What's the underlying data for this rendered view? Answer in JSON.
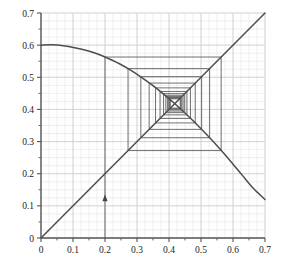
{
  "chart_data": {
    "type": "line",
    "title": "",
    "xlabel": "",
    "ylabel": "",
    "xlim": [
      0,
      0.7
    ],
    "ylim": [
      0,
      0.7
    ],
    "grid": true,
    "grid_major_step": 0.1,
    "grid_minor_step": 0.025,
    "legend": "none",
    "xticks": [
      0,
      0.1,
      0.2,
      0.3,
      0.4,
      0.5,
      0.6,
      0.7
    ],
    "yticks": [
      0,
      0.1,
      0.2,
      0.3,
      0.4,
      0.5,
      0.6,
      0.7
    ],
    "xtick_labels": [
      "0",
      "0.1",
      "0.2",
      "0.3",
      "0.4",
      "0.5",
      "0.6",
      "0.7"
    ],
    "ytick_labels": [
      "0",
      "0.1",
      "0.2",
      "0.3",
      "0.4",
      "0.5",
      "0.6",
      "0.7"
    ],
    "series": [
      {
        "name": "map-curve",
        "type": "line",
        "color": "#4d4d4d",
        "description": "concave-down map f(x) peaking near 0.60 at x=0 and falling to 0.12 at x=0.7",
        "points": [
          [
            0.0,
            0.6
          ],
          [
            0.035,
            0.601
          ],
          [
            0.07,
            0.598
          ],
          [
            0.105,
            0.592
          ],
          [
            0.14,
            0.584
          ],
          [
            0.175,
            0.573
          ],
          [
            0.2,
            0.563
          ],
          [
            0.245,
            0.542
          ],
          [
            0.28,
            0.522
          ],
          [
            0.315,
            0.499
          ],
          [
            0.35,
            0.474
          ],
          [
            0.385,
            0.446
          ],
          [
            0.42,
            0.416
          ],
          [
            0.455,
            0.384
          ],
          [
            0.49,
            0.35
          ],
          [
            0.525,
            0.314
          ],
          [
            0.56,
            0.276
          ],
          [
            0.595,
            0.236
          ],
          [
            0.63,
            0.194
          ],
          [
            0.665,
            0.153
          ],
          [
            0.7,
            0.12
          ]
        ]
      },
      {
        "name": "identity-line",
        "type": "line",
        "color": "#4d4d4d",
        "description": "y = x diagonal",
        "points": [
          [
            0.0,
            0.0
          ],
          [
            0.7,
            0.7
          ]
        ]
      },
      {
        "name": "cobweb-path",
        "type": "line",
        "color": "#555555",
        "description": "cobweb iteration starting at x0 = 0.2, spiralling inward to the fixed point near 0.43",
        "start_x": 0.2,
        "fixed_point": [
          0.432,
          0.432
        ],
        "points": [
          [
            0.2,
            0.0
          ],
          [
            0.2,
            0.563
          ],
          [
            0.563,
            0.563
          ],
          [
            0.563,
            0.272
          ],
          [
            0.272,
            0.272
          ],
          [
            0.272,
            0.527
          ],
          [
            0.527,
            0.527
          ],
          [
            0.527,
            0.312
          ],
          [
            0.312,
            0.312
          ],
          [
            0.312,
            0.502
          ],
          [
            0.502,
            0.502
          ],
          [
            0.502,
            0.338
          ],
          [
            0.338,
            0.338
          ],
          [
            0.338,
            0.482
          ],
          [
            0.482,
            0.482
          ],
          [
            0.482,
            0.358
          ],
          [
            0.358,
            0.358
          ],
          [
            0.358,
            0.467
          ],
          [
            0.467,
            0.467
          ],
          [
            0.467,
            0.372
          ],
          [
            0.372,
            0.372
          ],
          [
            0.372,
            0.456
          ],
          [
            0.456,
            0.456
          ],
          [
            0.456,
            0.383
          ],
          [
            0.383,
            0.383
          ],
          [
            0.383,
            0.449
          ],
          [
            0.449,
            0.449
          ],
          [
            0.449,
            0.39
          ],
          [
            0.39,
            0.39
          ],
          [
            0.39,
            0.444
          ],
          [
            0.444,
            0.444
          ],
          [
            0.444,
            0.395
          ],
          [
            0.395,
            0.395
          ],
          [
            0.395,
            0.44
          ],
          [
            0.44,
            0.44
          ],
          [
            0.44,
            0.399
          ],
          [
            0.399,
            0.399
          ],
          [
            0.399,
            0.437
          ],
          [
            0.437,
            0.437
          ],
          [
            0.437,
            0.402
          ],
          [
            0.402,
            0.402
          ],
          [
            0.402,
            0.435
          ],
          [
            0.435,
            0.435
          ],
          [
            0.435,
            0.404
          ],
          [
            0.404,
            0.404
          ],
          [
            0.404,
            0.433
          ],
          [
            0.433,
            0.433
          ]
        ]
      }
    ],
    "annotations": [
      {
        "name": "start-arrow",
        "type": "arrow",
        "x": 0.2,
        "y": 0.13,
        "direction": "up",
        "label": ""
      }
    ]
  },
  "axes": {
    "x_axis_name": "x-axis",
    "y_axis_name": "y-axis",
    "axis_color": "#555555",
    "grid_color": "#cfcfcf",
    "minor_grid_color": "#e4e4e4"
  }
}
